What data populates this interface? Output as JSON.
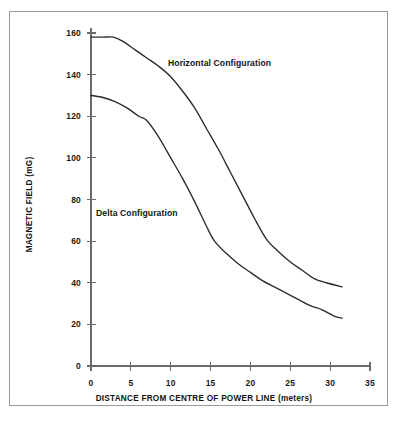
{
  "figure": {
    "background_color": "#ffffff",
    "border_color": "#9a9a9a",
    "line_color": "#2b2b2b",
    "axis_color": "#6b6b6b"
  },
  "chart_data": {
    "type": "line",
    "title": "",
    "xlabel": "DISTANCE FROM CENTRE OF POWER LINE (meters)",
    "ylabel": "MAGNETIC FIELD (mG)",
    "xlim": [
      0,
      35
    ],
    "ylim": [
      0,
      160
    ],
    "xticks": [
      0,
      5,
      10,
      15,
      20,
      25,
      30,
      35
    ],
    "yticks": [
      0,
      20,
      40,
      60,
      80,
      100,
      120,
      140,
      160
    ],
    "xtick_labels": [
      "0",
      "5",
      "10",
      "15",
      "20",
      "25",
      "30",
      "35"
    ],
    "ytick_labels": [
      "0",
      "20",
      "40",
      "60",
      "80",
      "100",
      "120",
      "140",
      "160"
    ],
    "grid": false,
    "legend": "inline-annotations",
    "series": [
      {
        "name": "Horizontal Configuration",
        "annotation_text": "Horizontal Configuration",
        "x": [
          0,
          1.5,
          2.8,
          4,
          5.5,
          7,
          8.5,
          10,
          11.5,
          13,
          14.5,
          16,
          17.5,
          19,
          20.5,
          22,
          23.5,
          25,
          26.5,
          28,
          29.5,
          31.5
        ],
        "y": [
          158,
          158,
          158,
          156,
          152,
          148,
          144,
          139,
          132,
          124,
          114,
          104,
          93,
          82,
          71,
          61,
          55,
          50,
          46,
          42,
          40,
          38
        ]
      },
      {
        "name": "Delta Configuration",
        "annotation_text": "Delta Configuration",
        "x": [
          0,
          1.5,
          3,
          4.5,
          6,
          7,
          8.5,
          10,
          11.5,
          13,
          14.5,
          15.5,
          17,
          18.5,
          20,
          21.5,
          23,
          24.5,
          26,
          27.5,
          29,
          30.5,
          31.5
        ],
        "y": [
          130,
          129,
          127,
          124,
          120,
          118,
          110,
          100,
          90,
          79,
          67,
          60,
          54,
          49,
          45,
          41,
          38,
          35,
          32,
          29,
          27,
          24,
          23
        ]
      }
    ]
  }
}
